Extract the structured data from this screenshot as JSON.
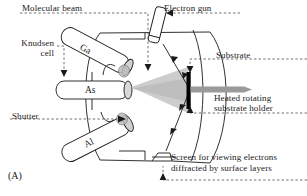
{
  "figure": {
    "panel_letter": "(A)",
    "title": "",
    "colors": {
      "line": "#1a1a1a",
      "beam_fill": "#c9c9c9",
      "substrate": "#000000",
      "holder_rod": "#9a9a9a",
      "cell_cap": "#b5b5b5",
      "background": "#ffffff"
    }
  },
  "labels": {
    "molecular_beam": "Molecular beam",
    "electron_gun": "Electron gun",
    "knudsen_cell_line1": "Knudsen",
    "knudsen_cell_line2": "cell",
    "substrate": "Substrate",
    "shutter": "Shutter",
    "heated_holder_line1": "Heated rotating",
    "heated_holder_line2": "substrate holder",
    "screen_line1": "Screen for viewing electrons",
    "screen_line2": "diffracted by surface layers"
  },
  "cells": [
    {
      "name": "Ga",
      "label": "Ga"
    },
    {
      "name": "As",
      "label": "As"
    },
    {
      "name": "Al",
      "label": "Al"
    }
  ],
  "components": [
    {
      "name": "vacuum-chamber",
      "label": "vacuum chamber"
    },
    {
      "name": "electron-gun",
      "label": "electron gun"
    },
    {
      "name": "substrate",
      "label": "substrate"
    },
    {
      "name": "substrate-holder-rod",
      "label": "heated rotating substrate holder"
    },
    {
      "name": "molecular-beam-cone",
      "label": "molecular beam"
    },
    {
      "name": "electron-beam-path",
      "label": "electron beam"
    },
    {
      "name": "rheed-screen",
      "label": "screen for viewing diffracted electrons"
    }
  ]
}
